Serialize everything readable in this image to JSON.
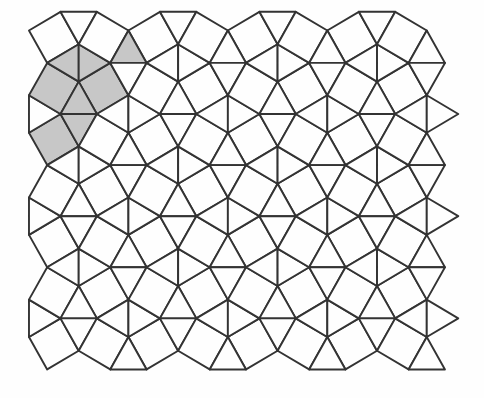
{
  "figure": {
    "figure_type": "snub-square-tiling",
    "vertex_configuration": "3.3.4.3.4",
    "canvas": {
      "width": 484,
      "height": 398
    },
    "colors": {
      "background": "#fefefe",
      "tile_fill": "#fefefe",
      "shade_fill": "#c7c7c7",
      "line_color": "#333333"
    },
    "line_width": 1.9,
    "geometry": {
      "edge_px_x": 36.4,
      "edge_px_y": 37.4,
      "origin_x": 60.5,
      "origin_y": 114,
      "lattice_u": [
        1.366,
        1.366
      ],
      "lattice_v": [
        1.366,
        -1.366
      ],
      "cell_i_range": [
        -8,
        12
      ],
      "cell_j_range": [
        -8,
        12
      ],
      "clip": {
        "xmin": 22,
        "xmax": 466,
        "ymin": 8,
        "ymax": 373
      }
    },
    "tiles": {
      "S1": {
        "kind": "square",
        "verts": [
          [
            0.5,
            0.866
          ],
          [
            0,
            0
          ],
          [
            -0.866,
            0.5
          ],
          [
            -0.366,
            1.366
          ]
        ]
      },
      "S2": {
        "kind": "square",
        "verts": [
          [
            1,
            0
          ],
          [
            0.5,
            0.866
          ],
          [
            1.366,
            1.366
          ],
          [
            1.866,
            0.5
          ]
        ]
      },
      "T1": {
        "kind": "triangle",
        "verts": [
          [
            0,
            0
          ],
          [
            1,
            0
          ],
          [
            0.5,
            0.866
          ]
        ]
      },
      "T2": {
        "kind": "triangle",
        "verts": [
          [
            0,
            0
          ],
          [
            0.5,
            -0.866
          ],
          [
            1,
            0
          ]
        ]
      },
      "T3": {
        "kind": "triangle",
        "verts": [
          [
            0.5,
            0.866
          ],
          [
            -0.366,
            1.366
          ],
          [
            0.5,
            1.866
          ]
        ]
      },
      "T4": {
        "kind": "triangle",
        "verts": [
          [
            0.5,
            0.866
          ],
          [
            0.5,
            1.866
          ],
          [
            1.366,
            1.366
          ]
        ]
      }
    },
    "shaded": [
      {
        "cell": [
          0,
          0
        ],
        "tile": "S1"
      },
      {
        "cell": [
          0,
          0
        ],
        "tile": "S2"
      },
      {
        "cell": [
          -1,
          0
        ],
        "tile": "S2"
      },
      {
        "cell": [
          0,
          0
        ],
        "tile": "T1"
      },
      {
        "cell": [
          0,
          0
        ],
        "tile": "T2"
      },
      {
        "cell": [
          0,
          0
        ],
        "tile": "T3"
      },
      {
        "cell": [
          0,
          0
        ],
        "tile": "T4"
      },
      {
        "cell": [
          1,
          0
        ],
        "tile": "T1"
      }
    ]
  }
}
